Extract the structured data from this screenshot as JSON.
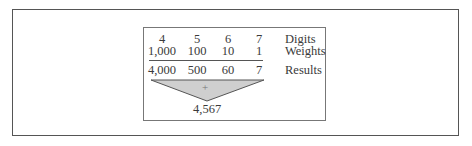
{
  "figure": {
    "columns": [
      {
        "digit": "4",
        "weight": "1,000",
        "result": "4,000"
      },
      {
        "digit": "5",
        "weight": "100",
        "result": "500"
      },
      {
        "digit": "6",
        "weight": "10",
        "result": "60"
      },
      {
        "digit": "7",
        "weight": "1",
        "result": "7"
      }
    ],
    "labels": {
      "digits": "Digits",
      "weights": "Weights",
      "results": "Results"
    },
    "operator": "+",
    "sum": "4,567",
    "colors": {
      "triangle_fill": "#cfcfcf",
      "stroke": "#555555",
      "text": "#3a3a3a"
    }
  }
}
